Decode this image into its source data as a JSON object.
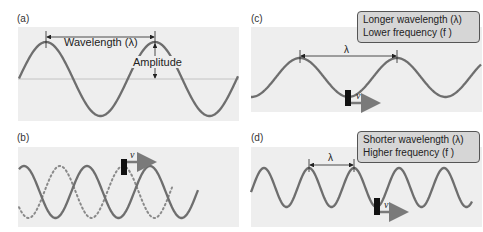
{
  "panels": {
    "a": {
      "label": "(a)",
      "wavelength_label": "Wavelength (λ)",
      "amplitude_label": "Amplitude"
    },
    "b": {
      "label": "(b)",
      "velocity_label": "v"
    },
    "c": {
      "label": "(c)",
      "info_line1": "Longer wavelength (λ)",
      "info_line2": "Lower frequency (f )",
      "wavelength_label": "λ",
      "velocity_label": "v"
    },
    "d": {
      "label": "(d)",
      "info_line1": "Shorter wavelength (λ)",
      "info_line2": "Higher frequency (f )",
      "wavelength_label": "λ",
      "velocity_label": "v"
    }
  },
  "colors": {
    "wave": "#6e6e6e",
    "panel_bg": "#eeeeee",
    "info_box_bg": "#d6d6d6",
    "marker": "#111111",
    "arrow": "#7a7a7a"
  }
}
